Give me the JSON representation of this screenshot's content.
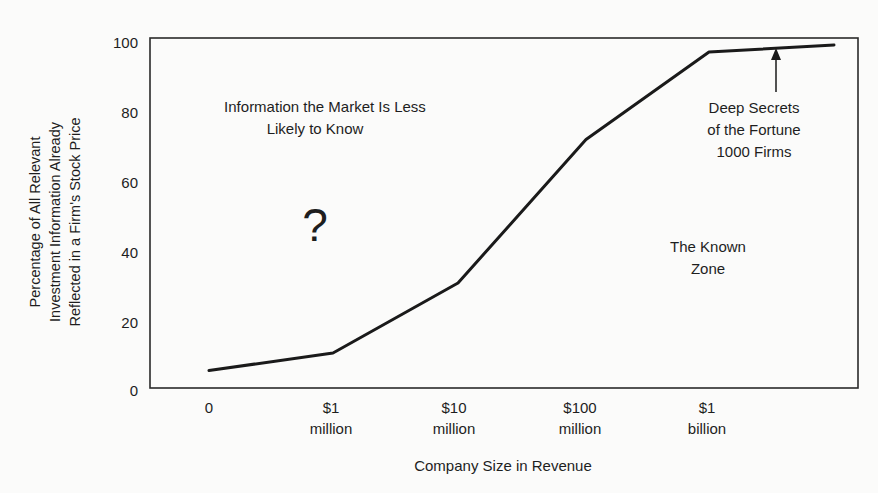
{
  "chart_data": {
    "type": "line",
    "title": "",
    "xlabel": "Company Size in Revenue",
    "ylabel": [
      "Percentage of All Relevant",
      "Investment Information Already",
      "Reflected in a Firm's Stock Price"
    ],
    "ylim": [
      0,
      100
    ],
    "yticks": [
      "0",
      "20",
      "40",
      "60",
      "80",
      "100"
    ],
    "categories": [
      [
        "0"
      ],
      [
        "$1",
        "million"
      ],
      [
        "$10",
        "million"
      ],
      [
        "$100",
        "million"
      ],
      [
        "$1",
        "billion"
      ],
      [
        ""
      ]
    ],
    "series": [
      {
        "name": "Information reflected in price",
        "values": [
          5,
          10,
          30,
          71,
          96,
          98
        ]
      }
    ],
    "grid": false,
    "legend": null,
    "annotations": [
      {
        "id": "less-known",
        "lines": [
          "Information the Market Is Less",
          "Likely to Know"
        ]
      },
      {
        "id": "question",
        "lines": [
          "?"
        ]
      },
      {
        "id": "known-zone",
        "lines": [
          "The Known",
          "Zone"
        ]
      },
      {
        "id": "deep-secrets",
        "lines": [
          "Deep Secrets",
          "of the Fortune",
          "1000 Firms"
        ],
        "arrow_to": "end of curve (~97%)"
      }
    ]
  },
  "colors": {
    "background": "#fbfbfa",
    "ink": "#1e1e1e"
  }
}
